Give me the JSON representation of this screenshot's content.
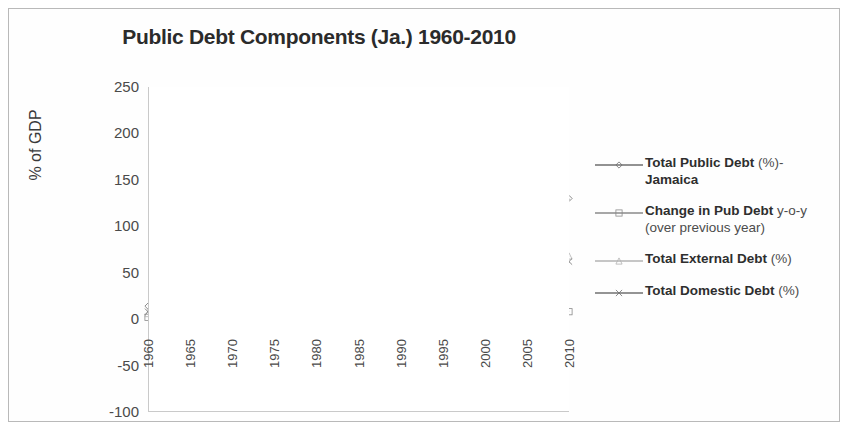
{
  "chart_data": {
    "type": "line",
    "title": "Public Debt Components (Ja.) 1960-2010",
    "xlabel": "",
    "ylabel": "% of GDP",
    "ylim": [
      -100,
      250
    ],
    "xlim": [
      1960,
      2010
    ],
    "yticks": [
      250,
      200,
      150,
      100,
      50,
      0,
      -50,
      -100
    ],
    "xticks": [
      1960,
      1965,
      1970,
      1975,
      1980,
      1985,
      1990,
      1995,
      2000,
      2005,
      2010
    ],
    "grid": true,
    "legend_position": "right",
    "x": [
      1960,
      1961,
      1962,
      1963,
      1964,
      1965,
      1966,
      1967,
      1968,
      1969,
      1970,
      1971,
      1972,
      1973,
      1974,
      1975,
      1976,
      1977,
      1978,
      1979,
      1980,
      1981,
      1982,
      1983,
      1984,
      1985,
      1986,
      1987,
      1988,
      1989,
      1990,
      1991,
      1992,
      1993,
      1994,
      1995,
      1996,
      1997,
      1998,
      1999,
      2000,
      2001,
      2002,
      2003,
      2004,
      2005,
      2006,
      2007,
      2008,
      2009,
      2010
    ],
    "series": [
      {
        "name": "Total Public Debt (%)-Jamaica",
        "marker": "diamond",
        "color": "#6e6e6e",
        "values": [
          14,
          15,
          16,
          17,
          18,
          19,
          20,
          21,
          22,
          22,
          23,
          24,
          26,
          28,
          30,
          33,
          42,
          55,
          68,
          80,
          95,
          110,
          135,
          200,
          212,
          190,
          178,
          150,
          132,
          118,
          178,
          150,
          118,
          100,
          88,
          78,
          72,
          80,
          95,
          112,
          122,
          128,
          132,
          138,
          132,
          126,
          122,
          114,
          108,
          122,
          130
        ]
      },
      {
        "name": "Change in Pub Debt y-o-y (over previous year)",
        "marker": "square",
        "color": "#8a8a8a",
        "values": [
          2,
          1,
          1,
          1,
          1,
          1,
          1,
          1,
          1,
          0,
          1,
          1,
          2,
          2,
          2,
          3,
          9,
          13,
          13,
          12,
          15,
          15,
          25,
          65,
          12,
          -22,
          -12,
          -28,
          -18,
          -14,
          60,
          -28,
          -32,
          -18,
          -12,
          -10,
          -6,
          8,
          15,
          17,
          10,
          6,
          4,
          6,
          -6,
          -6,
          -4,
          -8,
          -6,
          14,
          8
        ]
      },
      {
        "name": "Total External Debt (%)",
        "marker": "triangle",
        "color": "#b3b3b3",
        "values": [
          6,
          7,
          8,
          9,
          10,
          10,
          11,
          12,
          13,
          13,
          14,
          15,
          16,
          17,
          19,
          21,
          28,
          38,
          48,
          60,
          72,
          88,
          110,
          148,
          152,
          135,
          128,
          112,
          100,
          92,
          88,
          78,
          70,
          62,
          56,
          52,
          48,
          45,
          44,
          44,
          45,
          46,
          47,
          48,
          49,
          52,
          56,
          58,
          60,
          66,
          68
        ]
      },
      {
        "name": "Total Domestic Debt (%)",
        "marker": "x",
        "color": "#707070",
        "values": [
          8,
          8,
          8,
          8,
          8,
          9,
          9,
          9,
          9,
          9,
          9,
          9,
          10,
          11,
          11,
          12,
          14,
          17,
          20,
          20,
          23,
          22,
          25,
          52,
          60,
          55,
          52,
          38,
          32,
          26,
          90,
          72,
          48,
          38,
          32,
          26,
          24,
          35,
          51,
          68,
          77,
          82,
          85,
          90,
          83,
          74,
          66,
          56,
          48,
          56,
          62
        ]
      }
    ]
  },
  "legend": [
    {
      "label_bold": "Total Public Debt ",
      "label_thin": "(%)-",
      "line2": "Jamaica",
      "marker": "diamond"
    },
    {
      "label_bold": "Change in Pub Debt ",
      "label_thin": "y-o-y",
      "line2": "(over previous year)",
      "marker": "square"
    },
    {
      "label_bold": "Total External Debt ",
      "label_thin": "(%)",
      "line2": "",
      "marker": "triangle"
    },
    {
      "label_bold": "Total Domestic Debt ",
      "label_thin": "(%)",
      "line2": "",
      "marker": "x"
    }
  ]
}
